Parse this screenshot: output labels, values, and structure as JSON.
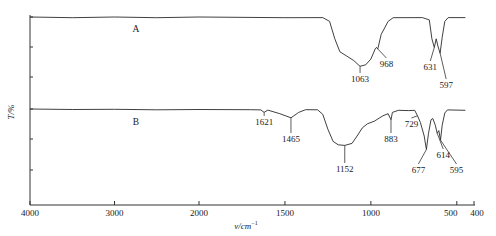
{
  "chart_data": {
    "type": "line",
    "title": "",
    "xlabel": "ν/cm⁻¹",
    "ylabel": "T/%",
    "x_axis": {
      "reversed": true,
      "broken_scale": true,
      "ticks": [
        4000,
        3000,
        2000,
        1500,
        1000,
        500,
        400
      ],
      "tick_labels": [
        "4000",
        "3000",
        "2000",
        "1500",
        "1000",
        "500",
        "400"
      ],
      "range": [
        4000,
        400
      ]
    },
    "y_axis": {
      "tick_labels_shown": false,
      "minor_ticks": true
    },
    "grid": false,
    "legend": null,
    "series": [
      {
        "name": "A",
        "label": "A",
        "baseline": "high",
        "points": [
          [
            4000,
            100
          ],
          [
            3500,
            99.5
          ],
          [
            3000,
            100
          ],
          [
            2500,
            99.5
          ],
          [
            2000,
            100
          ],
          [
            1500,
            99.5
          ],
          [
            1280,
            99.6
          ],
          [
            1240,
            97
          ],
          [
            1210,
            85
          ],
          [
            1180,
            76
          ],
          [
            1140,
            73
          ],
          [
            1100,
            70
          ],
          [
            1063,
            66
          ],
          [
            1030,
            67
          ],
          [
            1000,
            71
          ],
          [
            975,
            78
          ],
          [
            968,
            79
          ],
          [
            960,
            78
          ],
          [
            940,
            88
          ],
          [
            900,
            97
          ],
          [
            870,
            99.5
          ],
          [
            700,
            99.6
          ],
          [
            660,
            98
          ],
          [
            645,
            85
          ],
          [
            631,
            79
          ],
          [
            620,
            85
          ],
          [
            610,
            80
          ],
          [
            597,
            75
          ],
          [
            585,
            86
          ],
          [
            570,
            97
          ],
          [
            550,
            99.6
          ],
          [
            450,
            99.6
          ]
        ],
        "peaks": [
          {
            "wavenumber": 1063,
            "label": "1063"
          },
          {
            "wavenumber": 968,
            "label": "968"
          },
          {
            "wavenumber": 631,
            "label": "631"
          },
          {
            "wavenumber": 597,
            "label": "597"
          }
        ]
      },
      {
        "name": "B",
        "label": "B",
        "baseline": "lower offset",
        "points": [
          [
            4000,
            100
          ],
          [
            3500,
            99.6
          ],
          [
            3000,
            99.8
          ],
          [
            2500,
            99.4
          ],
          [
            2000,
            99.6
          ],
          [
            1700,
            99.5
          ],
          [
            1640,
            99.3
          ],
          [
            1621,
            97.5
          ],
          [
            1600,
            99.2
          ],
          [
            1530,
            96.5
          ],
          [
            1465,
            93.5
          ],
          [
            1420,
            97.5
          ],
          [
            1380,
            99.5
          ],
          [
            1310,
            99.4
          ],
          [
            1280,
            96
          ],
          [
            1250,
            85
          ],
          [
            1220,
            76
          ],
          [
            1190,
            73.5
          ],
          [
            1152,
            73
          ],
          [
            1110,
            74.5
          ],
          [
            1080,
            80
          ],
          [
            1050,
            86
          ],
          [
            1020,
            89
          ],
          [
            980,
            91
          ],
          [
            930,
            95
          ],
          [
            900,
            96.5
          ],
          [
            883,
            92
          ],
          [
            875,
            97.5
          ],
          [
            840,
            99
          ],
          [
            780,
            98.8
          ],
          [
            745,
            99
          ],
          [
            729,
            95
          ],
          [
            712,
            90
          ],
          [
            690,
            80
          ],
          [
            677,
            70
          ],
          [
            665,
            82
          ],
          [
            650,
            92
          ],
          [
            640,
            93
          ],
          [
            625,
            88
          ],
          [
            614,
            82
          ],
          [
            605,
            84
          ],
          [
            595,
            77
          ],
          [
            585,
            88
          ],
          [
            570,
            97
          ],
          [
            555,
            99.3
          ],
          [
            450,
            99
          ]
        ],
        "peaks": [
          {
            "wavenumber": 1621,
            "label": "1621"
          },
          {
            "wavenumber": 1465,
            "label": "1465"
          },
          {
            "wavenumber": 1152,
            "label": "1152"
          },
          {
            "wavenumber": 883,
            "label": "883"
          },
          {
            "wavenumber": 729,
            "label": "729"
          },
          {
            "wavenumber": 677,
            "label": "677"
          },
          {
            "wavenumber": 614,
            "label": "614"
          },
          {
            "wavenumber": 595,
            "label": "595"
          }
        ]
      }
    ]
  },
  "labels": {
    "y_axis_title": "T/%",
    "x_axis_title": "ν/cm",
    "x_axis_title_sup": "−1",
    "curve_a": "A",
    "curve_b": "B"
  }
}
